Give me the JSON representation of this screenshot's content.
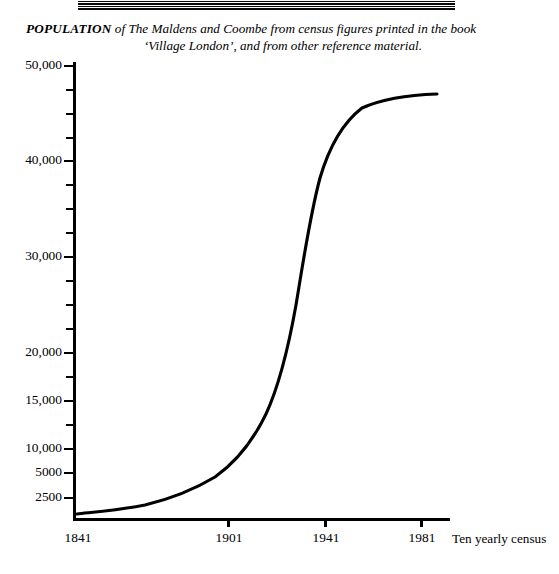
{
  "decoration": {
    "top_rule": "double-rule-ornament"
  },
  "caption": {
    "lead": "POPULATION",
    "line1_rest": " of The Maldens and Coombe from census figures printed in the book",
    "line2": "‘Village London’, and from other reference material."
  },
  "chart_data": {
    "type": "line",
    "xlabel": "Ten yearly census",
    "ylabel": "",
    "grid": false,
    "legend": null,
    "xlim": [
      1841,
      1991
    ],
    "ylim": [
      0,
      50000
    ],
    "y_axis_note": "Non-linear (compressed) scale below 20,000",
    "x_tick_labels": [
      "1841",
      "1901",
      "1941",
      "1981"
    ],
    "x_tick_values": [
      1841,
      1901,
      1941,
      1981
    ],
    "y_tick_labels": [
      "50,000",
      "40,000",
      "30,000",
      "20,000",
      "15,000",
      "10,000",
      "5000",
      "2500"
    ],
    "y_tick_values": [
      50000,
      40000,
      30000,
      20000,
      15000,
      10000,
      5000,
      2500
    ],
    "y_minor_tick_count": 12,
    "x": [
      1841,
      1851,
      1861,
      1871,
      1881,
      1891,
      1901,
      1911,
      1921,
      1931,
      1941,
      1951,
      1961,
      1971,
      1981,
      1991
    ],
    "values": [
      2000,
      2100,
      2300,
      2600,
      3200,
      4200,
      5800,
      8200,
      11500,
      17000,
      30000,
      38500,
      43000,
      45200,
      45900,
      46000
    ],
    "series": [
      {
        "name": "Population of The Maldens and Coombe",
        "values": [
          2000,
          2100,
          2300,
          2600,
          3200,
          4200,
          5800,
          8200,
          11500,
          17000,
          30000,
          38500,
          43000,
          45200,
          45900,
          46000
        ]
      }
    ],
    "colors": {
      "line": "#000000",
      "background": "#ffffff"
    }
  },
  "axes": {
    "y_ticks": [
      {
        "label": "50,000",
        "major": true,
        "top": 65
      },
      {
        "label": "",
        "major": false,
        "top": 89
      },
      {
        "label": "",
        "major": false,
        "top": 113
      },
      {
        "label": "",
        "major": false,
        "top": 137
      },
      {
        "label": "40,000",
        "major": true,
        "top": 160
      },
      {
        "label": "",
        "major": false,
        "top": 184
      },
      {
        "label": "",
        "major": false,
        "top": 208
      },
      {
        "label": "",
        "major": false,
        "top": 232
      },
      {
        "label": "30,000",
        "major": true,
        "top": 256
      },
      {
        "label": "",
        "major": false,
        "top": 280
      },
      {
        "label": "",
        "major": false,
        "top": 304
      },
      {
        "label": "",
        "major": false,
        "top": 328
      },
      {
        "label": "20,000",
        "major": true,
        "top": 352
      },
      {
        "label": "",
        "major": false,
        "top": 376
      },
      {
        "label": "15,000",
        "major": true,
        "top": 400
      },
      {
        "label": "",
        "major": false,
        "top": 424
      },
      {
        "label": "10,000",
        "major": true,
        "top": 448
      },
      {
        "label": "",
        "major": false,
        "top": 472
      },
      {
        "label": "5000",
        "major": true,
        "top": 472
      },
      {
        "label": "2500",
        "major": true,
        "top": 497
      }
    ],
    "x_ticks": [
      {
        "label": "1841",
        "left": 76
      },
      {
        "label": "1901",
        "left": 227
      },
      {
        "label": "1941",
        "left": 324
      },
      {
        "label": "1981",
        "left": 420
      }
    ],
    "x_axis_title": "Ten yearly census"
  },
  "curve": {
    "path": "M 77,514 C 95,512 120,510 145,505 C 170,499 195,489 215,477 C 235,463 252,443 266,414 C 278,388 288,350 296,305 C 303,263 310,215 320,178 C 330,144 345,121 362,108 C 382,99 408,95 437,94"
  }
}
